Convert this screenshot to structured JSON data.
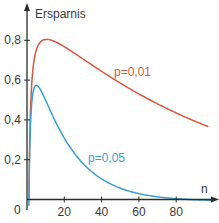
{
  "chart_data": {
    "type": "line",
    "title": "",
    "xlabel": "n",
    "ylabel": "Ersparnis",
    "xlim": [
      0,
      102
    ],
    "ylim": [
      0,
      0.9
    ],
    "grid": false,
    "legend": "inline labels",
    "x_ticks": [
      20,
      40,
      60,
      80
    ],
    "x_tick_labels": [
      "20",
      "40",
      "60",
      "80"
    ],
    "y_ticks": [
      0,
      0.2,
      0.4,
      0.6,
      0.8
    ],
    "y_tick_labels": [
      "0",
      "0,2",
      "0,4",
      "0,6",
      "0,8"
    ],
    "series": [
      {
        "name": "p=0,01",
        "color": "#d9573e",
        "formula": "1 - 1/n - (1 - (1-p)^n)",
        "p": 0.01,
        "x": [
          2,
          5,
          10,
          20,
          30,
          40,
          50,
          60,
          70,
          80,
          90,
          97
        ],
        "values": [
          0.48,
          0.75,
          0.8,
          0.77,
          0.71,
          0.64,
          0.59,
          0.53,
          0.48,
          0.44,
          0.39,
          0.37
        ]
      },
      {
        "name": "p=0,05",
        "color": "#3a9fd4",
        "formula": "1 - 1/n - (1 - (1-p)^n)",
        "p": 0.05,
        "x": [
          2,
          3,
          5,
          10,
          20,
          30,
          40,
          50,
          60,
          70,
          80,
          97
        ],
        "values": [
          0.4,
          0.52,
          0.57,
          0.5,
          0.31,
          0.18,
          0.1,
          0.06,
          0.03,
          0.01,
          0.0,
          -0.02
        ]
      }
    ]
  },
  "labels": {
    "y_axis_title": "Ersparnis",
    "x_axis_title": "n",
    "origin": "0",
    "series_a": "p=0,01",
    "series_b": "p=0,05"
  }
}
